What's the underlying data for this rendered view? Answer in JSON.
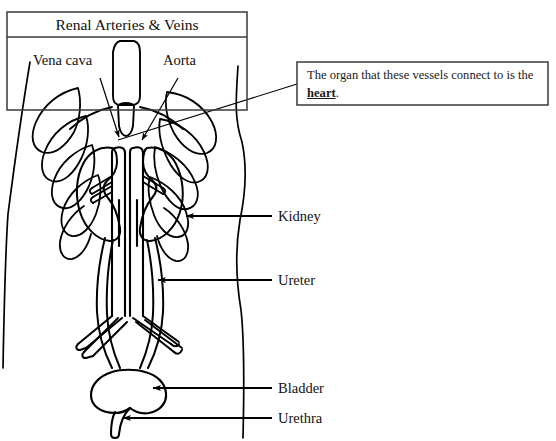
{
  "figure": {
    "title_box": {
      "title": "Renal Arteries & Veins",
      "vessel_labels": [
        {
          "name": "vena-cava",
          "text": "Vena cava"
        },
        {
          "name": "aorta",
          "text": "Aorta"
        }
      ]
    },
    "callout": {
      "text_before": "The organ that these vessels connect to is the ",
      "emphasis": "heart",
      "text_after": "."
    },
    "part_labels": [
      {
        "name": "kidney",
        "text": "Kidney"
      },
      {
        "name": "ureter",
        "text": "Ureter"
      },
      {
        "name": "bladder",
        "text": "Bladder"
      },
      {
        "name": "urethra",
        "text": "Urethra"
      }
    ],
    "colors": {
      "ink": "#000000",
      "background": "#ffffff",
      "box_border": "#3a3a3a",
      "text": "#111111"
    }
  }
}
